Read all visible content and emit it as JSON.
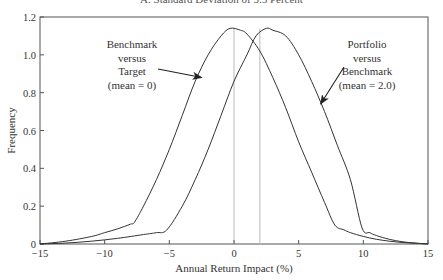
{
  "chart_data": {
    "type": "line",
    "title": "A. Standard Deviation of 5.5 Percent",
    "xlabel": "Annual Return Impact (%)",
    "ylabel": "Frequency",
    "xlim": [
      -15,
      15
    ],
    "ylim": [
      0,
      1.2
    ],
    "xticks": [
      "-15",
      "-10",
      "-5",
      "0",
      "5",
      "10",
      "15"
    ],
    "xtick_values": [
      -15,
      -10,
      -5,
      0,
      5,
      10,
      15
    ],
    "yticks": [
      "0",
      "0.2",
      "0.4",
      "0.6",
      "0.8",
      "1.0",
      "1.2"
    ],
    "ytick_values": [
      0,
      0.2,
      0.4,
      0.6,
      0.8,
      1.0,
      1.2
    ],
    "grid": false,
    "reference_lines_x": [
      0,
      2
    ],
    "series": [
      {
        "name": "Benchmark versus Target (mean = 0)",
        "x": [
          -15,
          -13,
          -11,
          -10,
          -9,
          -8,
          -7.7,
          -7,
          -6,
          -5,
          -4,
          -3,
          -2,
          -1,
          -0.3,
          0.5,
          1,
          2,
          3,
          4,
          5,
          6,
          7,
          7.8,
          8.5,
          9,
          10,
          11,
          12,
          13,
          14,
          15
        ],
        "y": [
          0.0,
          0.015,
          0.04,
          0.06,
          0.08,
          0.105,
          0.115,
          0.2,
          0.34,
          0.5,
          0.68,
          0.86,
          1.0,
          1.1,
          1.14,
          1.13,
          1.11,
          1.02,
          0.88,
          0.72,
          0.54,
          0.38,
          0.22,
          0.1,
          0.075,
          0.06,
          0.04,
          0.025,
          0.015,
          0.008,
          0.004,
          0.0
        ]
      },
      {
        "name": "Portfolio versus Benchmark (mean = 2.0)",
        "x": [
          -15,
          -13,
          -11,
          -9,
          -7,
          -6,
          -5.2,
          -4,
          -3,
          -2,
          -1,
          0,
          1,
          1.7,
          2.5,
          3,
          4,
          5,
          6,
          7,
          8,
          9,
          9.9,
          10.5,
          11,
          12,
          13,
          14,
          15
        ],
        "y": [
          0.0,
          0.005,
          0.015,
          0.03,
          0.05,
          0.06,
          0.074,
          0.2,
          0.34,
          0.5,
          0.68,
          0.86,
          1.0,
          1.1,
          1.14,
          1.13,
          1.1,
          1.0,
          0.86,
          0.7,
          0.52,
          0.34,
          0.085,
          0.06,
          0.045,
          0.025,
          0.012,
          0.005,
          0.0
        ]
      }
    ],
    "annotations": [
      {
        "lines": [
          "Benchmark",
          "versus",
          "Target",
          "(mean = 0)"
        ],
        "arrow_to": [
          -2.5,
          0.88
        ]
      },
      {
        "lines": [
          "Portfolio",
          "versus",
          "Benchmark",
          "(mean = 2.0)"
        ],
        "arrow_to": [
          6.7,
          0.74
        ]
      }
    ]
  }
}
